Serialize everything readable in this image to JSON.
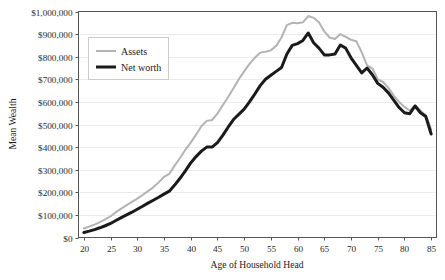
{
  "chart_data": {
    "type": "line",
    "title": "",
    "xlabel": "Age of Household Head",
    "ylabel": "Mean Wealth",
    "xlim": [
      19,
      86
    ],
    "ylim": [
      0,
      1000000
    ],
    "grid": true,
    "legend_position": "top-left",
    "y_ticks": [
      0,
      100000,
      200000,
      300000,
      400000,
      500000,
      600000,
      700000,
      800000,
      900000,
      1000000
    ],
    "y_tick_labels": [
      "$0",
      "$100,000",
      "$200,000",
      "$300,000",
      "$400,000",
      "$500,000",
      "$600,000",
      "$700,000",
      "$800,000",
      "$900,000",
      "$1,000,000"
    ],
    "x_ticks": [
      20,
      25,
      30,
      35,
      40,
      45,
      50,
      55,
      60,
      65,
      70,
      75,
      80,
      85
    ],
    "x_tick_labels": [
      "20",
      "25",
      "30",
      "35",
      "40",
      "45",
      "50",
      "55",
      "60",
      "65",
      "70",
      "75",
      "80",
      "85"
    ],
    "x": [
      20,
      21,
      22,
      23,
      24,
      25,
      26,
      27,
      28,
      29,
      30,
      31,
      32,
      33,
      34,
      35,
      36,
      37,
      38,
      39,
      40,
      41,
      42,
      43,
      44,
      45,
      46,
      47,
      48,
      49,
      50,
      51,
      52,
      53,
      54,
      55,
      56,
      57,
      58,
      59,
      60,
      61,
      62,
      63,
      64,
      65,
      66,
      67,
      68,
      69,
      70,
      71,
      72,
      73,
      74,
      75,
      76,
      77,
      78,
      79,
      80,
      81,
      82,
      83,
      84,
      85
    ],
    "series": [
      {
        "name": "Assets",
        "color": "#b3b3b3",
        "width": 2.0,
        "values": [
          40000,
          48000,
          57000,
          68000,
          80000,
          94000,
          112000,
          128000,
          143000,
          158000,
          172000,
          188000,
          205000,
          222000,
          244000,
          268000,
          282000,
          318000,
          352000,
          388000,
          420000,
          455000,
          492000,
          516000,
          520000,
          548000,
          585000,
          622000,
          660000,
          700000,
          735000,
          768000,
          795000,
          818000,
          822000,
          828000,
          848000,
          885000,
          940000,
          950000,
          948000,
          952000,
          980000,
          972000,
          952000,
          912000,
          885000,
          878000,
          900000,
          888000,
          875000,
          868000,
          820000,
          762000,
          748000,
          700000,
          688000,
          662000,
          628000,
          600000,
          578000,
          562000,
          585000,
          562000,
          540000,
          478000
        ]
      },
      {
        "name": "Net worth",
        "color": "#1a1a1a",
        "width": 3.0,
        "values": [
          22000,
          28000,
          35000,
          43000,
          52000,
          62000,
          75000,
          88000,
          100000,
          112000,
          125000,
          138000,
          152000,
          165000,
          178000,
          192000,
          205000,
          232000,
          262000,
          295000,
          330000,
          358000,
          382000,
          400000,
          400000,
          420000,
          452000,
          488000,
          522000,
          545000,
          568000,
          600000,
          635000,
          672000,
          700000,
          718000,
          735000,
          752000,
          812000,
          850000,
          858000,
          872000,
          905000,
          862000,
          838000,
          808000,
          808000,
          812000,
          852000,
          838000,
          795000,
          762000,
          728000,
          750000,
          720000,
          682000,
          665000,
          640000,
          608000,
          575000,
          552000,
          548000,
          582000,
          552000,
          535000,
          458000
        ]
      }
    ]
  },
  "legend": {
    "items": [
      {
        "label": "Assets"
      },
      {
        "label": "Net worth"
      }
    ]
  }
}
